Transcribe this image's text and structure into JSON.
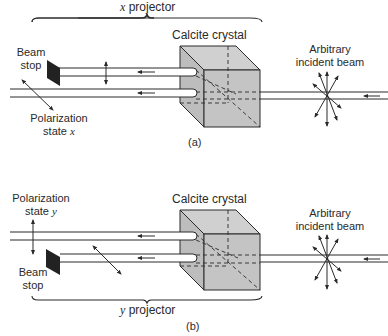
{
  "panel_a": {
    "projector_label_var": "x",
    "projector_label_text": " projector",
    "crystal_label": "Calcite crystal",
    "beam_stop_line1": "Beam",
    "beam_stop_line2": "stop",
    "polarization_line1": "Polarization",
    "polarization_line2": "state ",
    "polarization_var": "x",
    "incident_line1": "Arbitrary",
    "incident_line2": "incident beam",
    "caption": "(a)"
  },
  "panel_b": {
    "projector_label_var": "y",
    "projector_label_text": " projector",
    "crystal_label": "Calcite crystal",
    "beam_stop_line1": "Beam",
    "beam_stop_line2": "stop",
    "polarization_line1": "Polarization",
    "polarization_line2": "state ",
    "polarization_var": "y",
    "incident_line1": "Arbitrary",
    "incident_line2": "incident beam",
    "caption": "(b)"
  },
  "colors": {
    "crystal_fill": "#c4c4c4",
    "crystal_top": "#d2d2d2",
    "ink": "#2a2a2a",
    "beam_stop": "#222222"
  }
}
